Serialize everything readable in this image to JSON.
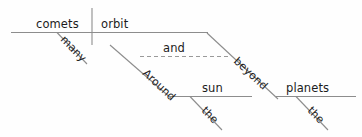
{
  "diagram": {
    "type": "reed-kellogg-sentence-diagram",
    "sentence": "Many comets orbit around the sun and beyond the planets",
    "background_color": "#fefefe",
    "line_color": "#8d8d8d",
    "text_color": "#1c1c1c",
    "words": {
      "subject": "comets",
      "subject_modifier": "many",
      "verb": "orbit",
      "conjunction": "and",
      "preposition_1": "Around",
      "object_1": "sun",
      "object_1_modifier": "the",
      "preposition_2": "beyond",
      "object_2": "planets",
      "object_2_modifier": "the"
    },
    "parts": [
      {
        "label": "comets",
        "role": "subject"
      },
      {
        "label": "orbit",
        "role": "predicate-verb"
      },
      {
        "label": "many",
        "role": "adjective-modifier"
      },
      {
        "label": "and",
        "role": "coordinating-conjunction"
      },
      {
        "label": "Around",
        "role": "preposition"
      },
      {
        "label": "sun",
        "role": "object-of-preposition"
      },
      {
        "label": "the",
        "role": "article-modifier"
      },
      {
        "label": "beyond",
        "role": "preposition"
      },
      {
        "label": "planets",
        "role": "object-of-preposition"
      },
      {
        "label": "the",
        "role": "article-modifier"
      }
    ]
  }
}
